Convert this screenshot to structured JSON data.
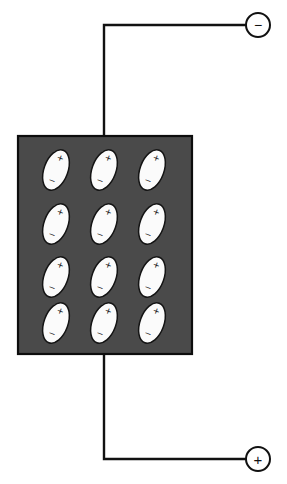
{
  "figure": {
    "background_color": "#ffffff",
    "width": 287,
    "height": 484
  },
  "slab": {
    "name": "dielectric-slab",
    "fill_color": "#4a4a4a",
    "border_color": "#0d0d0d",
    "x": 18,
    "y": 136,
    "width": 174,
    "height": 218
  },
  "dipoles": {
    "rows": 4,
    "columns": 3,
    "count": 12,
    "positive_label": "+",
    "negative_label": "−",
    "fill_color": "#fbfbfb",
    "outline_color": "#141414",
    "rotation_degrees": 20,
    "ellipse_rx": 12,
    "ellipse_ry": 21,
    "column_centers": [
      56,
      104,
      152
    ],
    "row_centers": [
      170,
      224,
      277,
      323
    ],
    "items": [
      {
        "row": 1,
        "col": 1,
        "cx": 56,
        "cy": 170,
        "positive": "+",
        "negative": "−"
      },
      {
        "row": 1,
        "col": 2,
        "cx": 104,
        "cy": 170,
        "positive": "+",
        "negative": "−"
      },
      {
        "row": 1,
        "col": 3,
        "cx": 152,
        "cy": 170,
        "positive": "+",
        "negative": "−"
      },
      {
        "row": 2,
        "col": 1,
        "cx": 56,
        "cy": 224,
        "positive": "+",
        "negative": "−"
      },
      {
        "row": 2,
        "col": 2,
        "cx": 104,
        "cy": 224,
        "positive": "+",
        "negative": "−"
      },
      {
        "row": 2,
        "col": 3,
        "cx": 152,
        "cy": 224,
        "positive": "+",
        "negative": "−"
      },
      {
        "row": 3,
        "col": 1,
        "cx": 56,
        "cy": 277,
        "positive": "+",
        "negative": "−"
      },
      {
        "row": 3,
        "col": 2,
        "cx": 104,
        "cy": 277,
        "positive": "+",
        "negative": "−"
      },
      {
        "row": 3,
        "col": 3,
        "cx": 152,
        "cy": 277,
        "positive": "+",
        "negative": "−"
      },
      {
        "row": 4,
        "col": 1,
        "cx": 56,
        "cy": 323,
        "positive": "+",
        "negative": "−"
      },
      {
        "row": 4,
        "col": 2,
        "cx": 104,
        "cy": 323,
        "positive": "+",
        "negative": "−"
      },
      {
        "row": 4,
        "col": 3,
        "cx": 152,
        "cy": 323,
        "positive": "+",
        "negative": "−"
      }
    ]
  },
  "terminals": [
    {
      "name": "negative-terminal",
      "sign": "−",
      "polarity": "negative",
      "cx": 258,
      "cy": 25,
      "radius": 12,
      "fill_color": "#ffffff",
      "stroke_color": "#111111"
    },
    {
      "name": "positive-terminal",
      "sign": "+",
      "polarity": "positive",
      "cx": 258,
      "cy": 459,
      "radius": 12,
      "fill_color": "#ffffff",
      "stroke_color": "#111111"
    }
  ],
  "wires": [
    {
      "name": "top-wire",
      "from": "slab-top-edge",
      "to": "negative-terminal",
      "path": "M 104 136 L 104 25 L 246 25",
      "stroke_color": "#111111",
      "stroke_width": 2.4
    },
    {
      "name": "bottom-wire",
      "from": "slab-bottom-edge",
      "to": "positive-terminal",
      "path": "M 104 354 L 104 459 L 246 459",
      "stroke_color": "#111111",
      "stroke_width": 2.4
    }
  ]
}
